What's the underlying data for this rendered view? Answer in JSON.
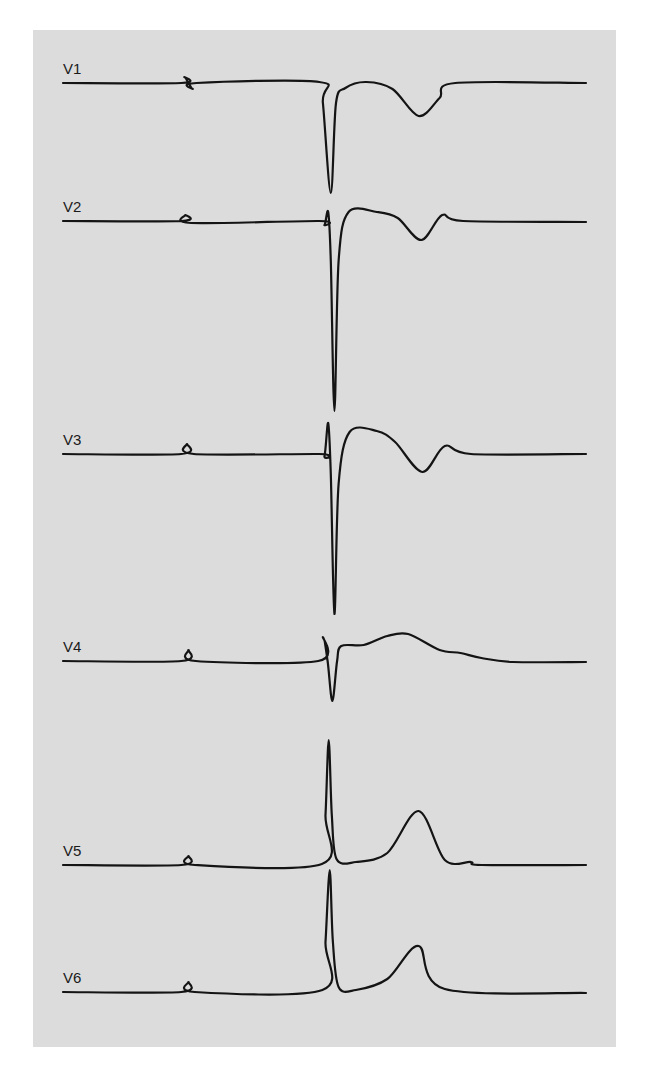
{
  "chart_data": {
    "type": "line",
    "title": "",
    "xlabel": "",
    "ylabel": "",
    "grid": false,
    "x_units": "normalized beat time (0-1)",
    "y_units": "relative amplitude (baseline = 0, up positive)",
    "series": [
      {
        "name": "V1",
        "points": [
          [
            0,
            0
          ],
          [
            0.226,
            0
          ],
          [
            0.232,
            0.6
          ],
          [
            0.24,
            0
          ],
          [
            0.248,
            -0.6
          ],
          [
            0.255,
            0
          ],
          [
            0.49,
            0.1
          ],
          [
            0.497,
            -2
          ],
          [
            0.512,
            -11
          ],
          [
            0.522,
            -2
          ],
          [
            0.54,
            -0.5
          ],
          [
            0.58,
            0.1
          ],
          [
            0.63,
            -0.6
          ],
          [
            0.68,
            -3.3
          ],
          [
            0.72,
            -1.5
          ],
          [
            0.75,
            0
          ],
          [
            1,
            0
          ]
        ]
      },
      {
        "name": "V2",
        "points": [
          [
            0,
            0
          ],
          [
            0.226,
            0
          ],
          [
            0.234,
            0.6
          ],
          [
            0.245,
            -0.2
          ],
          [
            0.49,
            0
          ],
          [
            0.5,
            -0.4
          ],
          [
            0.507,
            0.9
          ],
          [
            0.512,
            -4
          ],
          [
            0.519,
            -19
          ],
          [
            0.527,
            -4
          ],
          [
            0.546,
            0.9
          ],
          [
            0.6,
            0.9
          ],
          [
            0.64,
            0.3
          ],
          [
            0.685,
            -1.9
          ],
          [
            0.725,
            0.6
          ],
          [
            0.765,
            0
          ],
          [
            1,
            -0.1
          ]
        ]
      },
      {
        "name": "V3",
        "points": [
          [
            0,
            0
          ],
          [
            0.226,
            0
          ],
          [
            0.237,
            1
          ],
          [
            0.25,
            0
          ],
          [
            0.49,
            0
          ],
          [
            0.5,
            -0.2
          ],
          [
            0.507,
            3.1
          ],
          [
            0.512,
            -2
          ],
          [
            0.519,
            -16
          ],
          [
            0.527,
            -3
          ],
          [
            0.548,
            2.2
          ],
          [
            0.6,
            2.3
          ],
          [
            0.635,
            1.2
          ],
          [
            0.687,
            -1.8
          ],
          [
            0.73,
            0.8
          ],
          [
            0.78,
            0
          ],
          [
            1,
            0
          ]
        ]
      },
      {
        "name": "V4",
        "points": [
          [
            0,
            0
          ],
          [
            0.226,
            0
          ],
          [
            0.24,
            1.1
          ],
          [
            0.254,
            0
          ],
          [
            0.488,
            0
          ],
          [
            0.497,
            2.4
          ],
          [
            0.506,
            0
          ],
          [
            0.515,
            -4
          ],
          [
            0.524,
            0
          ],
          [
            0.532,
            1.5
          ],
          [
            0.575,
            1.6
          ],
          [
            0.62,
            2.5
          ],
          [
            0.66,
            2.7
          ],
          [
            0.72,
            1.1
          ],
          [
            0.76,
            0.8
          ],
          [
            0.8,
            0.3
          ],
          [
            0.86,
            -0.1
          ],
          [
            1,
            -0.1
          ]
        ]
      },
      {
        "name": "V5",
        "points": [
          [
            0,
            0
          ],
          [
            0.226,
            0
          ],
          [
            0.24,
            0.9
          ],
          [
            0.252,
            0
          ],
          [
            0.495,
            0.1
          ],
          [
            0.502,
            5
          ],
          [
            0.508,
            12.5
          ],
          [
            0.514,
            5
          ],
          [
            0.523,
            0.6
          ],
          [
            0.56,
            0.3
          ],
          [
            0.62,
            1.2
          ],
          [
            0.68,
            5.4
          ],
          [
            0.73,
            0.5
          ],
          [
            0.78,
            0.3
          ],
          [
            0.8,
            0
          ],
          [
            1,
            0
          ]
        ]
      },
      {
        "name": "V6",
        "points": [
          [
            0,
            0
          ],
          [
            0.226,
            0
          ],
          [
            0.24,
            1
          ],
          [
            0.252,
            0
          ],
          [
            0.496,
            0.2
          ],
          [
            0.502,
            5
          ],
          [
            0.51,
            12.2
          ],
          [
            0.516,
            5
          ],
          [
            0.527,
            0.5
          ],
          [
            0.56,
            0.2
          ],
          [
            0.62,
            1.3
          ],
          [
            0.68,
            4.6
          ],
          [
            0.73,
            0.3
          ],
          [
            1,
            -0.1
          ]
        ]
      }
    ]
  }
}
